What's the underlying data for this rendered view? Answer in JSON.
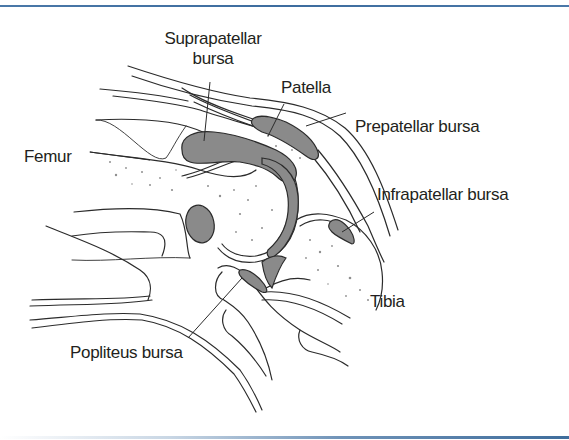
{
  "figure": {
    "colors": {
      "frame": "#3f6d9c",
      "bursa_fill": "#8a8a8a",
      "line": "#2b2b2b",
      "background": "#ffffff"
    },
    "labels": {
      "suprapatellar_line1": "Suprapatellar",
      "suprapatellar_line2": "bursa",
      "patella": "Patella",
      "prepatellar": "Prepatellar bursa",
      "femur": "Femur",
      "infrapatellar": "Infrapatellar bursa",
      "tibia": "Tibia",
      "popliteus": "Popliteus bursa"
    }
  }
}
